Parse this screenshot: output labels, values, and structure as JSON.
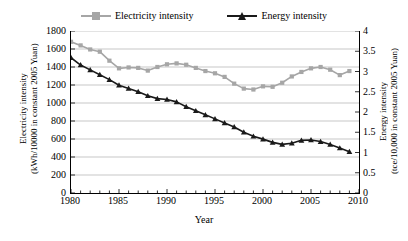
{
  "chart_data": {
    "type": "line",
    "title": "",
    "xlabel": "Year",
    "ylabel": "Electricity intensity (kWh/10000 in constant 2005 Yuan)",
    "y2label": "Energy intensity (tce/10,000 in constant 2005 Yuan)",
    "xlim": [
      1980,
      2010
    ],
    "ylim": [
      0,
      1800
    ],
    "y2lim": [
      0,
      4
    ],
    "xticks": [
      1980,
      1985,
      1990,
      1995,
      2000,
      2005,
      2010
    ],
    "xtick_labels": [
      "1980",
      "1985",
      "1990",
      "1995",
      "2000",
      "2005",
      "2010"
    ],
    "xminor_step": 1,
    "yticks": [
      0,
      200,
      400,
      600,
      800,
      1000,
      1200,
      1400,
      1600,
      1800
    ],
    "ytick_labels": [
      "0",
      "200",
      "400",
      "600",
      "800",
      "1000",
      "1200",
      "1400",
      "1600",
      "1800"
    ],
    "y2ticks": [
      0,
      0.5,
      1,
      1.5,
      2,
      2.5,
      3,
      3.5,
      4
    ],
    "y2tick_labels": [
      "0",
      "0.5",
      "1",
      "1.5",
      "2",
      "2.5",
      "3",
      "3.5",
      "4"
    ],
    "grid": "horizontal",
    "legend_position": "top-center",
    "x": [
      1980,
      1981,
      1982,
      1983,
      1984,
      1985,
      1986,
      1987,
      1988,
      1989,
      1990,
      1991,
      1992,
      1993,
      1994,
      1995,
      1996,
      1997,
      1998,
      1999,
      2000,
      2001,
      2002,
      2003,
      2004,
      2005,
      2006,
      2007,
      2008,
      2009
    ],
    "series": [
      {
        "name": "Electricity intensity",
        "axis": "left",
        "color": "#a6a6a6",
        "marker": "square",
        "units": "kWh/10000 in constant 2005 Yuan",
        "values": [
          1680,
          1640,
          1595,
          1570,
          1470,
          1385,
          1395,
          1390,
          1360,
          1400,
          1430,
          1440,
          1425,
          1390,
          1355,
          1330,
          1290,
          1215,
          1160,
          1150,
          1185,
          1180,
          1225,
          1295,
          1345,
          1385,
          1400,
          1370,
          1310,
          1355
        ]
      },
      {
        "name": "Energy intensity",
        "axis": "right",
        "color": "#1a1a1a",
        "marker": "triangle",
        "units": "tce/10,000 in constant 2005 Yuan",
        "values": [
          3.34,
          3.16,
          3.04,
          2.92,
          2.8,
          2.66,
          2.58,
          2.5,
          2.4,
          2.33,
          2.31,
          2.25,
          2.13,
          2.03,
          1.93,
          1.83,
          1.73,
          1.63,
          1.5,
          1.4,
          1.33,
          1.25,
          1.2,
          1.23,
          1.3,
          1.31,
          1.27,
          1.2,
          1.11,
          1.02
        ]
      }
    ]
  }
}
